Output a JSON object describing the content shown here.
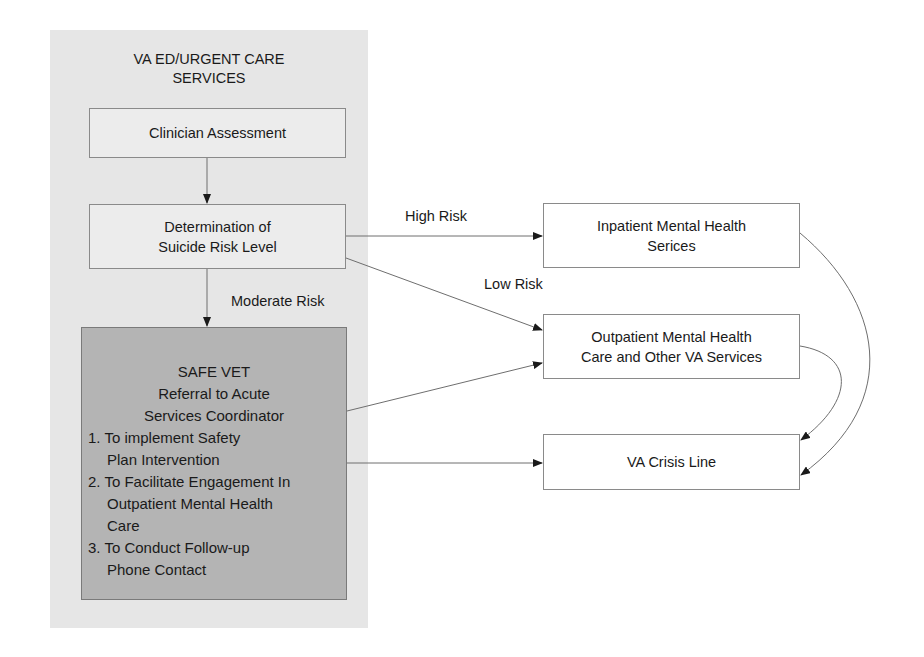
{
  "container": {
    "title_line1": "VA ED/URGENT CARE",
    "title_line2": "SERVICES"
  },
  "nodes": {
    "clinician_assessment": {
      "label": "Clinician Assessment"
    },
    "determination": {
      "line1": "Determination of",
      "line2": "Suicide Risk Level"
    },
    "safe_vet": {
      "line1": "SAFE VET",
      "line2": "Referral to Acute",
      "line3": "Services Coordinator",
      "items": [
        {
          "num": "1.",
          "first": "To implement Safety",
          "rest": [
            "Plan Intervention"
          ]
        },
        {
          "num": "2.",
          "first": "To Facilitate Engagement In",
          "rest": [
            "Outpatient Mental Health",
            "Care"
          ]
        },
        {
          "num": "3.",
          "first": "To Conduct Follow-up",
          "rest": [
            "Phone Contact"
          ]
        }
      ]
    },
    "inpatient": {
      "line1": "Inpatient Mental Health",
      "line2": "Serices"
    },
    "outpatient": {
      "line1": "Outpatient Mental Health",
      "line2": "Care and Other VA Services"
    },
    "crisis_line": {
      "label": "VA Crisis Line"
    }
  },
  "edge_labels": {
    "high_risk": "High Risk",
    "low_risk": "Low Risk",
    "moderate_risk": "Moderate Risk"
  },
  "edges": [
    {
      "from": "clinician_assessment",
      "to": "determination",
      "label": ""
    },
    {
      "from": "determination",
      "to": "safe_vet",
      "label": "Moderate Risk"
    },
    {
      "from": "determination",
      "to": "inpatient",
      "label": "High Risk"
    },
    {
      "from": "determination",
      "to": "outpatient",
      "label": "Low Risk"
    },
    {
      "from": "safe_vet",
      "to": "outpatient",
      "label": ""
    },
    {
      "from": "safe_vet",
      "to": "crisis_line",
      "label": ""
    },
    {
      "from": "inpatient",
      "to": "crisis_line",
      "label": ""
    },
    {
      "from": "outpatient",
      "to": "crisis_line",
      "label": ""
    }
  ],
  "colors": {
    "panel_bg": "#e6e6e6",
    "safe_vet_bg": "#b4b4b4",
    "line": "#6e6e6e"
  }
}
